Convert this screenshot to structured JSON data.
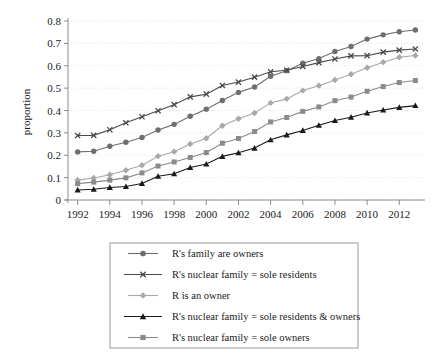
{
  "chart_data": {
    "type": "line",
    "title": "",
    "xlabel": "",
    "ylabel": "proportion",
    "xlim": [
      1991.4,
      2013.6
    ],
    "ylim": [
      0,
      0.8
    ],
    "grid": true,
    "legend_position": "below-plot",
    "x": [
      1992,
      1993,
      1994,
      1995,
      1996,
      1997,
      1998,
      1999,
      2000,
      2001,
      2002,
      2003,
      2004,
      2005,
      2006,
      2007,
      2008,
      2009,
      2010,
      2011,
      2012,
      2013
    ],
    "xticks": [
      1992,
      1994,
      1996,
      1998,
      2000,
      2002,
      2004,
      2006,
      2008,
      2010,
      2012
    ],
    "xtick_labels": [
      "1992",
      "1994",
      "1996",
      "1998",
      "2000",
      "2002",
      "2004",
      "2006",
      "2008",
      "2010",
      "2012"
    ],
    "yticks": [
      0,
      0.1,
      0.2,
      0.3,
      0.4,
      0.5,
      0.6,
      0.7,
      0.8
    ],
    "ytick_labels": [
      "0",
      "0.1",
      "0.2",
      "0.3",
      "0.4",
      "0.5",
      "0.6",
      "0.7",
      "0.8"
    ],
    "series": [
      {
        "name": "R's family are owners",
        "marker": "circle",
        "color": "#6e6e6e",
        "line_color": "#6e6e6e",
        "values": [
          0.215,
          0.218,
          0.24,
          0.258,
          0.279,
          0.313,
          0.338,
          0.374,
          0.406,
          0.445,
          0.481,
          0.505,
          0.553,
          0.578,
          0.611,
          0.632,
          0.664,
          0.686,
          0.719,
          0.738,
          0.752,
          0.76
        ]
      },
      {
        "name": "R's nuclear family = sole residents",
        "marker": "x",
        "color": "#4a4a4a",
        "line_color": "#4a4a4a",
        "values": [
          0.288,
          0.289,
          0.314,
          0.345,
          0.372,
          0.399,
          0.426,
          0.461,
          0.473,
          0.512,
          0.527,
          0.549,
          0.573,
          0.58,
          0.597,
          0.614,
          0.63,
          0.644,
          0.645,
          0.661,
          0.67,
          0.675
        ]
      },
      {
        "name": "R is an owner",
        "marker": "diamond",
        "color": "#a8a8a8",
        "line_color": "#a8a8a8",
        "values": [
          0.089,
          0.098,
          0.113,
          0.133,
          0.155,
          0.196,
          0.216,
          0.25,
          0.276,
          0.332,
          0.363,
          0.389,
          0.434,
          0.452,
          0.489,
          0.511,
          0.536,
          0.562,
          0.591,
          0.616,
          0.638,
          0.646
        ]
      },
      {
        "name": "R's nuclear family = sole residents & owners",
        "marker": "triangle",
        "color": "#1a1a1a",
        "line_color": "#1a1a1a",
        "values": [
          0.045,
          0.048,
          0.056,
          0.06,
          0.074,
          0.106,
          0.117,
          0.145,
          0.161,
          0.195,
          0.211,
          0.232,
          0.269,
          0.291,
          0.311,
          0.334,
          0.355,
          0.37,
          0.389,
          0.402,
          0.414,
          0.422
        ]
      },
      {
        "name": "R's nuclear family = sole owners",
        "marker": "square",
        "color": "#8a8a8a",
        "line_color": "#8a8a8a",
        "values": [
          0.073,
          0.08,
          0.089,
          0.099,
          0.121,
          0.152,
          0.17,
          0.19,
          0.212,
          0.254,
          0.275,
          0.306,
          0.349,
          0.369,
          0.396,
          0.416,
          0.444,
          0.46,
          0.486,
          0.507,
          0.525,
          0.534
        ]
      }
    ]
  },
  "legend": {
    "items": [
      "R's family are owners",
      "R's nuclear family = sole residents",
      "R is an owner",
      "R's nuclear family = sole residents & owners",
      "R's nuclear family = sole owners"
    ]
  },
  "axes": {
    "y_title": "proportion"
  }
}
